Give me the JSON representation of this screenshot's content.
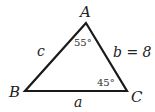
{
  "diagram": {
    "type": "triangle",
    "stroke_color": "#1a1a1a",
    "vertices": {
      "A": {
        "label": "A",
        "x": 86,
        "y": 23
      },
      "B": {
        "label": "B",
        "x": 25,
        "y": 91
      },
      "C": {
        "label": "C",
        "x": 127,
        "y": 91
      }
    },
    "sides": {
      "a": {
        "label": "a"
      },
      "b": {
        "label": "b = 8"
      },
      "c": {
        "label": "c"
      }
    },
    "angles": {
      "A": {
        "label": "55°"
      },
      "C": {
        "label": "45°"
      }
    }
  }
}
